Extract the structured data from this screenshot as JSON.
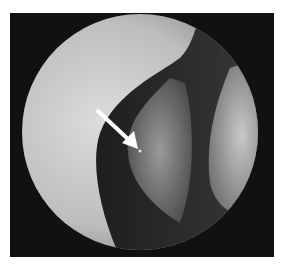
{
  "figure": {
    "type": "endoscopic-photograph",
    "annotation": {
      "kind": "arrow",
      "color": "#ffffff",
      "direction": "down-right"
    },
    "colors": {
      "background": "#ffffff",
      "frame": "#111111",
      "tissue_light": "#d8d8d8",
      "tissue_dark": "#2a2a2a"
    }
  }
}
